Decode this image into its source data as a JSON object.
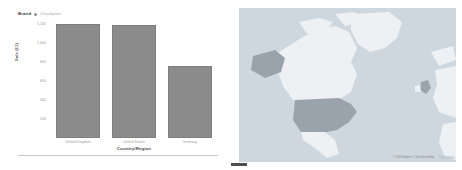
{
  "chart_data": {
    "type": "bar",
    "title": "",
    "categories": [
      "United Kingdom",
      "United States",
      "Germany"
    ],
    "values": [
      1200,
      1190,
      760
    ],
    "xlabel": "Country/Region",
    "ylabel": "Sale (£1)",
    "ylim": [
      0,
      1200
    ],
    "yticks": [
      200,
      400,
      600,
      800,
      1000,
      1200
    ],
    "ytick_labels": [
      "200",
      "400",
      "600",
      "800",
      "1,000",
      "1,200"
    ],
    "grid": false,
    "legend_position": "top-left",
    "series": [
      {
        "name": "Champion",
        "values": [
          1200,
          1190,
          760
        ],
        "color": "#8c8c8c"
      }
    ],
    "bar_color": "#8c8c8c"
  },
  "bar_panel": {
    "legend": {
      "title": "Brand",
      "swatch_icon": "circle-swatch-icon",
      "entry_label": "Champion"
    },
    "y_axis_title": "Sale (£1)",
    "x_axis_title": "Country/Region"
  },
  "map_panel": {
    "attribution": "© 2024 Mapbox © OpenStreetMap",
    "logo": "Tableau",
    "base_color": "#cfd7de",
    "land_color": "#eef1f3",
    "highlight_color": "#9aa3ab",
    "regions": [
      {
        "name": "United States",
        "highlighted": true
      },
      {
        "name": "Alaska",
        "highlighted": true
      },
      {
        "name": "United Kingdom",
        "highlighted": true
      },
      {
        "name": "Canada",
        "highlighted": false
      },
      {
        "name": "Mexico",
        "highlighted": false
      },
      {
        "name": "Greenland",
        "highlighted": false
      }
    ]
  }
}
